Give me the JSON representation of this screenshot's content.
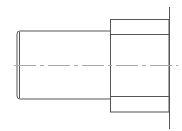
{
  "drawing": {
    "type": "technical-drawing",
    "description": "Side view of stepped cylindrical shaft with flange",
    "line_color": "#555555",
    "centerline_color": "#aaaaaa",
    "shaft": {
      "x1": 16,
      "x2": 110,
      "y1": 31,
      "y2": 99
    },
    "flange": {
      "x1": 110,
      "x2": 169,
      "y1": 19,
      "y2": 112
    },
    "flange_inner_lines": [
      34,
      96
    ],
    "face_line": {
      "x": 169,
      "y1": 7,
      "y2": 129
    },
    "centerline_y": 65
  }
}
